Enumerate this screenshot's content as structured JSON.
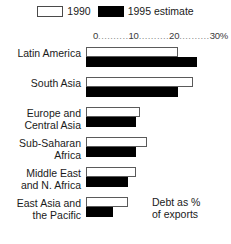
{
  "legend": {
    "entries": [
      {
        "label": "1990",
        "swatch": "white-outline-swatch",
        "color": "#ffffff"
      },
      {
        "label": "1995 estimate",
        "swatch": "black-filled-swatch",
        "color": "#000000"
      }
    ]
  },
  "axis": {
    "tick_0": "0",
    "tick_10": "10",
    "tick_20": "20",
    "tick_30": "30%",
    "dots": ".........."
  },
  "annotation": {
    "line1": "Debt as %",
    "line2": "of exports"
  },
  "chart_data": {
    "type": "bar",
    "orientation": "horizontal",
    "title": "",
    "subtitle": "",
    "xlabel": "Debt as % of exports",
    "ylabel": "",
    "xlim": [
      0,
      30
    ],
    "xticks": [
      0,
      10,
      20,
      30
    ],
    "xtick_labels": [
      "0",
      "10",
      "20",
      "30%"
    ],
    "grid": false,
    "legend_position": "top-center",
    "categories": [
      "Latin America",
      "South Asia",
      "Europe and Central Asia",
      "Sub-Saharan Africa",
      "Middle East and N. Africa",
      "East Asia and the Pacific"
    ],
    "category_lines": [
      [
        "Latin America"
      ],
      [
        "South Asia"
      ],
      [
        "Europe and",
        "Central Asia"
      ],
      [
        "Sub-Saharan",
        "Africa"
      ],
      [
        "Middle East",
        "and N. Africa"
      ],
      [
        "East Asia and",
        "the Pacific"
      ]
    ],
    "series": [
      {
        "name": "1990",
        "color": "#ffffff",
        "values": [
          24,
          28,
          14,
          16,
          13,
          11
        ]
      },
      {
        "name": "1995 estimate",
        "color": "#000000",
        "values": [
          29,
          24,
          13,
          13,
          11,
          7
        ]
      }
    ]
  }
}
